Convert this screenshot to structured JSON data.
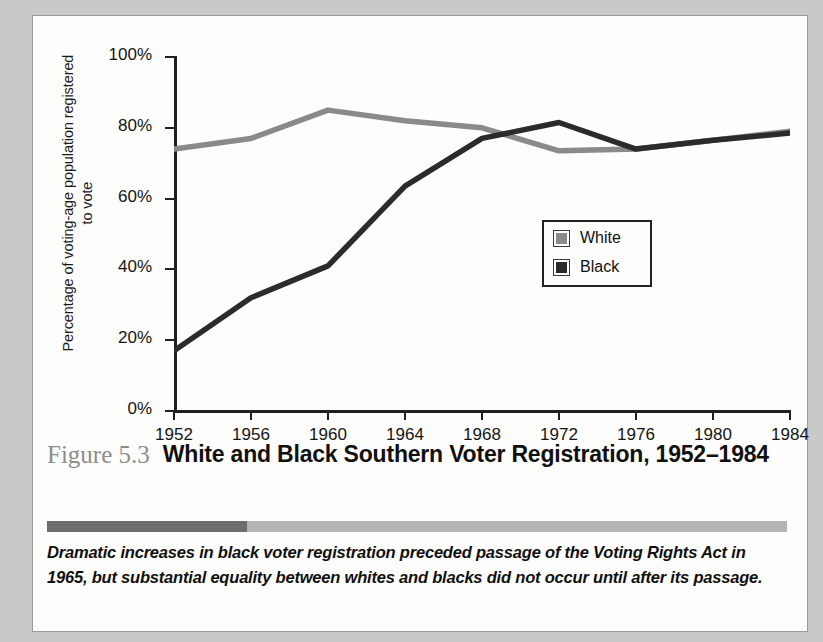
{
  "figure": {
    "number": "Figure 5.3",
    "title": "White and Black Southern Voter Registration, 1952–1984",
    "caption": "Dramatic increases in black voter registration preceded passage of the Voting Rights Act in 1965, but substantial equality between whites and blacks did not occur until after its passage."
  },
  "colors": {
    "white_series": "#8a8a8a",
    "black_series": "#2b2b2b",
    "axis": "#202020",
    "fignum": "#8d8d8b",
    "rule_dark": "#6d6d6b",
    "rule_light": "#b4b4b2",
    "card_background": "#fdfdfb",
    "page_background": "#c9c9c7"
  },
  "chart_data": {
    "type": "line",
    "title": "White and Black Southern Voter Registration, 1952–1984",
    "xlabel": "",
    "ylabel": "Percentage of voting-age population registered to vote",
    "x": [
      1952,
      1956,
      1960,
      1964,
      1968,
      1972,
      1976,
      1980,
      1984
    ],
    "xtick_labels": [
      "1952",
      "1956",
      "1960",
      "1964",
      "1968",
      "1972",
      "1976",
      "1980",
      "1984"
    ],
    "ytick_labels": [
      "0%",
      "20%",
      "40%",
      "60%",
      "80%",
      "100%"
    ],
    "yticks": [
      0,
      20,
      40,
      60,
      80,
      100
    ],
    "ylim": [
      0,
      100
    ],
    "xlim": [
      1952,
      1984
    ],
    "grid": false,
    "legend_position": "center-right",
    "series": [
      {
        "name": "White",
        "color": "#8a8a8a",
        "values": [
          74,
          77,
          85,
          82,
          80,
          73.5,
          74,
          76.5,
          79
        ]
      },
      {
        "name": "Black",
        "color": "#2b2b2b",
        "values": [
          17,
          32,
          41,
          63.5,
          77,
          81.5,
          74,
          76.5,
          78.5
        ]
      }
    ]
  }
}
